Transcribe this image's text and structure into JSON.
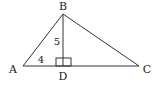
{
  "diagram": {
    "type": "triangle-with-altitude",
    "vertices": {
      "A": {
        "label": "A",
        "x": 23,
        "y": 66,
        "lx": 13,
        "ly": 73
      },
      "B": {
        "label": "B",
        "x": 63,
        "y": 14,
        "lx": 63,
        "ly": 10
      },
      "C": {
        "label": "C",
        "x": 139,
        "y": 66,
        "lx": 147,
        "ly": 73
      },
      "D": {
        "label": "D",
        "x": 63,
        "y": 66,
        "lx": 63,
        "ly": 80
      }
    },
    "segments": [
      {
        "from": "A",
        "to": "B"
      },
      {
        "from": "B",
        "to": "C"
      },
      {
        "from": "A",
        "to": "C"
      },
      {
        "from": "B",
        "to": "D"
      }
    ],
    "measures": {
      "BD": {
        "text": "5",
        "x": 57,
        "y": 45
      },
      "AD": {
        "text": "4",
        "x": 41,
        "y": 63
      }
    },
    "right_angle": {
      "at": "D",
      "x": 56,
      "y": 58,
      "w": 15,
      "h": 8
    },
    "colors": {
      "stroke": "#333333",
      "text": "#222222",
      "background": "#ffffff"
    }
  }
}
